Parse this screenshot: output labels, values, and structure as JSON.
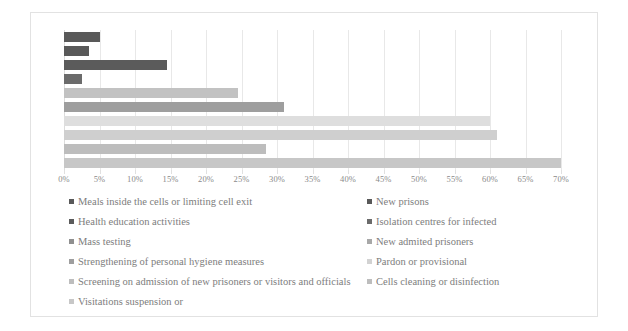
{
  "chart_data": {
    "type": "bar",
    "orientation": "horizontal",
    "title": "",
    "subtitle": "",
    "xlabel": "",
    "ylabel": "",
    "xlim": [
      0,
      70
    ],
    "xunit": "%",
    "grid": true,
    "legend_position": "bottom",
    "legend_columns": 2,
    "xticklabels": [
      "0%",
      "5%",
      "10%",
      "15%",
      "20%",
      "25%",
      "30%",
      "35%",
      "40%",
      "45%",
      "50%",
      "55%",
      "60%",
      "65%",
      "70%"
    ],
    "xtickvalues": [
      0,
      5,
      10,
      15,
      20,
      25,
      30,
      35,
      40,
      45,
      50,
      55,
      60,
      65,
      70
    ],
    "categories": [
      "Meals inside the cells or limiting cell exit",
      "New prisons",
      "Health education activities",
      "Isolation centres for infected",
      "Mass testing",
      "New admited prisoners",
      "Strengthening of personal hygiene measures",
      "Pardon or provisional",
      "Screening on admission  of new  prisoners or visitors and officials",
      "Cells cleaning or disinfection",
      "Visitations suspension or"
    ],
    "bars": [
      {
        "label": "Meals inside the cells or limiting cell exit",
        "value": 5.0,
        "color": "#595959"
      },
      {
        "label": "New prisons",
        "value": 3.5,
        "color": "#595959"
      },
      {
        "label": "Health education activities",
        "value": 14.5,
        "color": "#5b5b5b"
      },
      {
        "label": "Isolation centres for infected",
        "value": 2.5,
        "color": "#6b6b6b"
      },
      {
        "label": "Mass testing",
        "value": 24.5,
        "color": "#c2c2c2"
      },
      {
        "label": "New admited prisoners",
        "value": 31.0,
        "color": "#9e9e9e"
      },
      {
        "label": "Strengthening of personal hygiene measures",
        "value": 60.0,
        "color": "#dedede"
      },
      {
        "label": "Pardon or provisional",
        "value": 61.0,
        "color": "#cfcfcf"
      },
      {
        "label": "Screening on admission  of new  prisoners or visitors and officials",
        "value": 28.5,
        "color": "#bdbdbd"
      },
      {
        "label": "Cells cleaning or disinfection",
        "value": 70.0,
        "color": "#c7c7c7"
      }
    ]
  },
  "legend": {
    "rows": [
      {
        "left": {
          "label": "Meals inside the cells or limiting cell exit",
          "color": "#595959"
        },
        "right": {
          "label": "New prisons",
          "color": "#595959"
        }
      },
      {
        "left": {
          "label": "Health education activities",
          "color": "#5b5b5b"
        },
        "right": {
          "label": "Isolation centres for infected",
          "color": "#6b6b6b"
        }
      },
      {
        "left": {
          "label": "Mass testing",
          "color": "#8f8f8f"
        },
        "right": {
          "label": "New admited prisoners",
          "color": "#a8a8a8"
        }
      },
      {
        "left": {
          "label": "Strengthening of personal hygiene measures",
          "color": "#9e9e9e"
        },
        "right": {
          "label": "Pardon or provisional",
          "color": "#d2d2d2"
        }
      },
      {
        "left": {
          "label": "Screening on admission  of new  prisoners or visitors and officials",
          "color": "#bdbdbd"
        },
        "right": {
          "label": "Cells cleaning or disinfection",
          "color": "#bdbdbd"
        }
      },
      {
        "left": {
          "label": "Visitations suspension or",
          "color": "#c7c7c7"
        },
        "right": null
      }
    ]
  },
  "colors": {
    "card_border": "#e2e2e2",
    "gridline": "#e8e8e8",
    "tick_text": "#8a8a8a",
    "legend_text": "#7d7d7d",
    "background": "#ffffff"
  }
}
